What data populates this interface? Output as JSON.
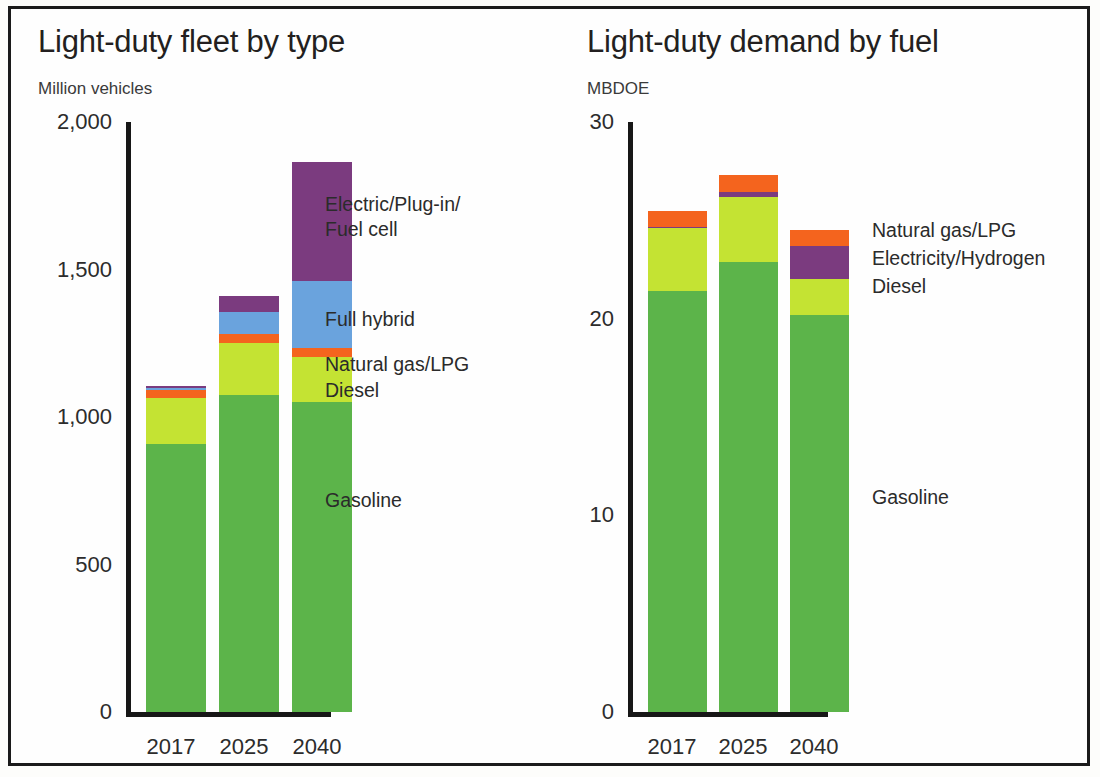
{
  "chart_data": [
    {
      "type": "bar",
      "stacked": true,
      "title": "Light-duty fleet by type",
      "subtitle": "Million vehicles",
      "ylabel": "Million vehicles",
      "xlabel": "",
      "categories": [
        "2017",
        "2025",
        "2040"
      ],
      "ytick_labels": [
        "0",
        "500",
        "1,000",
        "1,500",
        "2,000"
      ],
      "yticks": [
        0,
        500,
        1000,
        1500,
        2000
      ],
      "ylim": [
        0,
        2000
      ],
      "grid": false,
      "legend_position": "right-inline-callouts",
      "series": [
        {
          "name": "Gasoline",
          "color": "#5cb44a",
          "values": [
            910,
            1075,
            1050
          ]
        },
        {
          "name": "Diesel",
          "color": "#c4e333",
          "values": [
            155,
            175,
            155
          ]
        },
        {
          "name": "Natural gas/LPG",
          "color": "#f4641e",
          "values": [
            25,
            30,
            30
          ]
        },
        {
          "name": "Full hybrid",
          "color": "#6aa3dd",
          "values": [
            10,
            75,
            225
          ]
        },
        {
          "name": "Electric/Plug-in/Fuel cell",
          "color": "#7b3b7f",
          "values": [
            5,
            55,
            405
          ]
        }
      ],
      "totals": [
        1105,
        1410,
        1865
      ]
    },
    {
      "type": "bar",
      "stacked": true,
      "title": "Light-duty demand by fuel",
      "subtitle": "MBDOE",
      "ylabel": "MBDOE",
      "xlabel": "",
      "categories": [
        "2017",
        "2025",
        "2040"
      ],
      "ytick_labels": [
        "0",
        "10",
        "20",
        "30"
      ],
      "yticks": [
        0,
        10,
        20,
        30
      ],
      "ylim": [
        0,
        30
      ],
      "grid": false,
      "legend_position": "right-inline-callouts",
      "series": [
        {
          "name": "Gasoline",
          "color": "#5cb44a",
          "values": [
            21.4,
            22.9,
            20.2
          ]
        },
        {
          "name": "Diesel",
          "color": "#c4e333",
          "values": [
            3.2,
            3.3,
            1.8
          ]
        },
        {
          "name": "Electricity/Hydrogen",
          "color": "#7b3b7f",
          "values": [
            0.05,
            0.25,
            1.7
          ]
        },
        {
          "name": "Natural gas/LPG",
          "color": "#f4641e",
          "values": [
            0.85,
            0.85,
            0.8
          ]
        }
      ],
      "totals": [
        25.5,
        27.3,
        24.5
      ]
    }
  ],
  "left_chart": {
    "title": "Light-duty fleet by type",
    "subtitle": "Million vehicles",
    "ytick_labels": [
      "2,000",
      "1,500",
      "1,000",
      "500",
      "0"
    ],
    "xtick_labels": [
      "2017",
      "2025",
      "2040"
    ],
    "callouts": {
      "electric": "Electric/Plug-in/\nFuel cell",
      "full_hybrid": "Full hybrid",
      "natural_gas": "Natural gas/LPG",
      "diesel": "Diesel",
      "gasoline": "Gasoline"
    }
  },
  "right_chart": {
    "title": "Light-duty demand by fuel",
    "subtitle": "MBDOE",
    "ytick_labels": [
      "30",
      "20",
      "10",
      "0"
    ],
    "xtick_labels": [
      "2017",
      "2025",
      "2040"
    ],
    "callouts": {
      "natural_gas": "Natural gas/LPG",
      "electricity": "Electricity/Hydrogen",
      "diesel": "Diesel",
      "gasoline": "Gasoline"
    }
  },
  "colors": {
    "gasoline": "#5cb44a",
    "diesel": "#c4e333",
    "natural_gas_lpg": "#f4641e",
    "full_hybrid": "#6aa3dd",
    "electric": "#7b3b7f",
    "axis": "#171717",
    "text": "#2c2c2c",
    "background": "#fefefe"
  }
}
